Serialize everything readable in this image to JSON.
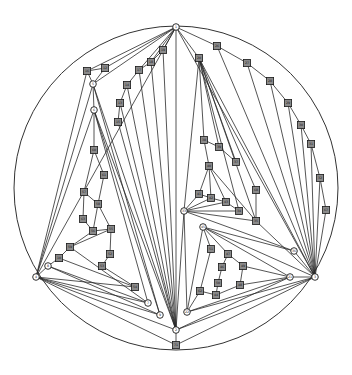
{
  "diagram": {
    "type": "planar-graph-drawing",
    "outer_circle": {
      "cx": 176,
      "cy": 188,
      "r": 162
    },
    "colors": {
      "edge": "#2a2a2a",
      "square_fill": "#8a8a8a",
      "circle_fill": "#ffffff",
      "stroke": "#1a1a1a"
    },
    "nodes": [
      {
        "id": "top",
        "shape": "circle",
        "x": 176,
        "y": 27,
        "label": "1"
      },
      {
        "id": "bot",
        "shape": "circle",
        "x": 176,
        "y": 330,
        "label": "2"
      },
      {
        "id": "botsq",
        "shape": "square",
        "x": 176,
        "y": 345,
        "label": "71"
      },
      {
        "id": "left",
        "shape": "circle",
        "x": 36,
        "y": 277,
        "label": "4"
      },
      {
        "id": "right",
        "shape": "circle",
        "x": 315,
        "y": 277,
        "label": "3"
      },
      {
        "id": "l1",
        "shape": "square",
        "x": 87,
        "y": 71,
        "label": "16"
      },
      {
        "id": "l2",
        "shape": "square",
        "x": 105,
        "y": 68,
        "label": "12"
      },
      {
        "id": "l3",
        "shape": "circle",
        "x": 93,
        "y": 84,
        "label": "5"
      },
      {
        "id": "l4",
        "shape": "circle",
        "x": 94,
        "y": 110,
        "label": "6"
      },
      {
        "id": "c1",
        "shape": "square",
        "x": 163,
        "y": 50,
        "label": "19"
      },
      {
        "id": "c2",
        "shape": "square",
        "x": 151,
        "y": 62,
        "label": "18"
      },
      {
        "id": "c3",
        "shape": "square",
        "x": 139,
        "y": 70,
        "label": "17"
      },
      {
        "id": "c4",
        "shape": "square",
        "x": 127,
        "y": 85,
        "label": "14"
      },
      {
        "id": "c5",
        "shape": "square",
        "x": 120,
        "y": 103,
        "label": "13"
      },
      {
        "id": "c6",
        "shape": "square",
        "x": 118,
        "y": 122,
        "label": "15"
      },
      {
        "id": "i1",
        "shape": "square",
        "x": 94,
        "y": 150,
        "label": "60"
      },
      {
        "id": "i2",
        "shape": "square",
        "x": 104,
        "y": 175,
        "label": "61"
      },
      {
        "id": "i3",
        "shape": "square",
        "x": 84,
        "y": 192,
        "label": "57"
      },
      {
        "id": "i4",
        "shape": "square",
        "x": 98,
        "y": 204,
        "label": "58"
      },
      {
        "id": "i5",
        "shape": "square",
        "x": 83,
        "y": 219,
        "label": "63"
      },
      {
        "id": "i6",
        "shape": "square",
        "x": 93,
        "y": 231,
        "label": "56"
      },
      {
        "id": "i7",
        "shape": "square",
        "x": 111,
        "y": 229,
        "label": "55"
      },
      {
        "id": "i8",
        "shape": "square",
        "x": 110,
        "y": 254,
        "label": "52"
      },
      {
        "id": "i9",
        "shape": "square",
        "x": 70,
        "y": 247,
        "label": "59"
      },
      {
        "id": "i10",
        "shape": "square",
        "x": 59,
        "y": 258,
        "label": "10"
      },
      {
        "id": "i11",
        "shape": "circle",
        "x": 48,
        "y": 266,
        "label": "8"
      },
      {
        "id": "i12",
        "shape": "square",
        "x": 102,
        "y": 266,
        "label": "53"
      },
      {
        "id": "i13",
        "shape": "square",
        "x": 135,
        "y": 287,
        "label": "54"
      },
      {
        "id": "i14",
        "shape": "circle",
        "x": 148,
        "y": 303,
        "label": "7"
      },
      {
        "id": "i15",
        "shape": "circle",
        "x": 160,
        "y": 315,
        "label": "9"
      },
      {
        "id": "r1",
        "shape": "square",
        "x": 217,
        "y": 46,
        "label": "26"
      },
      {
        "id": "r2",
        "shape": "square",
        "x": 199,
        "y": 58,
        "label": "20"
      },
      {
        "id": "r3",
        "shape": "square",
        "x": 247,
        "y": 63,
        "label": "27"
      },
      {
        "id": "r4",
        "shape": "square",
        "x": 270,
        "y": 81,
        "label": "28"
      },
      {
        "id": "r5",
        "shape": "square",
        "x": 288,
        "y": 103,
        "label": "29"
      },
      {
        "id": "r6",
        "shape": "square",
        "x": 301,
        "y": 125,
        "label": "30"
      },
      {
        "id": "r7",
        "shape": "square",
        "x": 311,
        "y": 144,
        "label": "31"
      },
      {
        "id": "r8",
        "shape": "square",
        "x": 320,
        "y": 178,
        "label": "32"
      },
      {
        "id": "r9",
        "shape": "square",
        "x": 326,
        "y": 210,
        "label": "67"
      },
      {
        "id": "m1",
        "shape": "square",
        "x": 204,
        "y": 140,
        "label": "38"
      },
      {
        "id": "m2",
        "shape": "square",
        "x": 219,
        "y": 147,
        "label": "39"
      },
      {
        "id": "m3",
        "shape": "square",
        "x": 236,
        "y": 162,
        "label": "37"
      },
      {
        "id": "m4",
        "shape": "square",
        "x": 209,
        "y": 166,
        "label": "40"
      },
      {
        "id": "m5",
        "shape": "square",
        "x": 256,
        "y": 190,
        "label": "68"
      },
      {
        "id": "m6",
        "shape": "square",
        "x": 199,
        "y": 194,
        "label": "41"
      },
      {
        "id": "m7",
        "shape": "square",
        "x": 211,
        "y": 198,
        "label": "42"
      },
      {
        "id": "m8",
        "shape": "square",
        "x": 226,
        "y": 202,
        "label": "43"
      },
      {
        "id": "m9",
        "shape": "square",
        "x": 239,
        "y": 211,
        "label": "34"
      },
      {
        "id": "m10",
        "shape": "square",
        "x": 256,
        "y": 221,
        "label": "35"
      },
      {
        "id": "mh",
        "shape": "circle",
        "x": 184,
        "y": 211,
        "label": "33"
      },
      {
        "id": "mh2",
        "shape": "circle",
        "x": 203,
        "y": 227,
        "label": "45"
      },
      {
        "id": "mh3",
        "shape": "circle",
        "x": 294,
        "y": 251,
        "label": "36"
      },
      {
        "id": "n1",
        "shape": "square",
        "x": 211,
        "y": 249,
        "label": "51"
      },
      {
        "id": "n2",
        "shape": "square",
        "x": 228,
        "y": 254,
        "label": "47"
      },
      {
        "id": "n3",
        "shape": "square",
        "x": 222,
        "y": 267,
        "label": "46"
      },
      {
        "id": "n4",
        "shape": "square",
        "x": 243,
        "y": 266,
        "label": "49"
      },
      {
        "id": "n5",
        "shape": "square",
        "x": 218,
        "y": 283,
        "label": "50"
      },
      {
        "id": "n6",
        "shape": "square",
        "x": 240,
        "y": 285,
        "label": "48"
      },
      {
        "id": "n7",
        "shape": "square",
        "x": 200,
        "y": 291,
        "label": "62"
      },
      {
        "id": "n8",
        "shape": "square",
        "x": 216,
        "y": 295,
        "label": "44"
      },
      {
        "id": "nh",
        "shape": "circle",
        "x": 290,
        "y": 277,
        "label": "21"
      },
      {
        "id": "nh2",
        "shape": "circle",
        "x": 187,
        "y": 312,
        "label": "22"
      }
    ],
    "edges": [
      [
        "top",
        "bot"
      ],
      [
        "bot",
        "botsq"
      ],
      [
        "top",
        "l1"
      ],
      [
        "top",
        "l2"
      ],
      [
        "top",
        "l3"
      ],
      [
        "l1",
        "l2"
      ],
      [
        "l1",
        "l3"
      ],
      [
        "l2",
        "l3"
      ],
      [
        "top",
        "c1"
      ],
      [
        "top",
        "c2"
      ],
      [
        "top",
        "c3"
      ],
      [
        "c1",
        "c2"
      ],
      [
        "c2",
        "c3"
      ],
      [
        "c3",
        "c4"
      ],
      [
        "c4",
        "c5"
      ],
      [
        "c5",
        "c6"
      ],
      [
        "c1",
        "bot"
      ],
      [
        "c2",
        "bot"
      ],
      [
        "c3",
        "bot"
      ],
      [
        "c4",
        "bot"
      ],
      [
        "c5",
        "bot"
      ],
      [
        "c6",
        "bot"
      ],
      [
        "l1",
        "left"
      ],
      [
        "l3",
        "left"
      ],
      [
        "l3",
        "l4"
      ],
      [
        "l3",
        "bot"
      ],
      [
        "l4",
        "bot"
      ],
      [
        "l4",
        "left"
      ],
      [
        "l4",
        "i1"
      ],
      [
        "l4",
        "i14"
      ],
      [
        "l4",
        "i15"
      ],
      [
        "l3",
        "i15"
      ],
      [
        "i1",
        "i2"
      ],
      [
        "i1",
        "i3"
      ],
      [
        "i2",
        "i4"
      ],
      [
        "i3",
        "i4"
      ],
      [
        "i3",
        "i5"
      ],
      [
        "i4",
        "i6"
      ],
      [
        "i4",
        "i7"
      ],
      [
        "i5",
        "i6"
      ],
      [
        "i6",
        "i7"
      ],
      [
        "i6",
        "i9"
      ],
      [
        "i7",
        "i8"
      ],
      [
        "i8",
        "i12"
      ],
      [
        "i9",
        "i10"
      ],
      [
        "i10",
        "i11"
      ],
      [
        "i9",
        "i7"
      ],
      [
        "i11",
        "left"
      ],
      [
        "i10",
        "i13"
      ],
      [
        "i9",
        "i14"
      ],
      [
        "i11",
        "i14"
      ],
      [
        "i12",
        "i13"
      ],
      [
        "i11",
        "i15"
      ],
      [
        "left",
        "i14"
      ],
      [
        "left",
        "i15"
      ],
      [
        "left",
        "bot"
      ],
      [
        "left",
        "botsq"
      ],
      [
        "left",
        "i13"
      ],
      [
        "top",
        "r1"
      ],
      [
        "top",
        "r2"
      ],
      [
        "r1",
        "r3"
      ],
      [
        "r3",
        "r4"
      ],
      [
        "r4",
        "r5"
      ],
      [
        "r5",
        "r6"
      ],
      [
        "r6",
        "r7"
      ],
      [
        "r7",
        "r8"
      ],
      [
        "r8",
        "r9"
      ],
      [
        "r9",
        "right"
      ],
      [
        "r1",
        "right"
      ],
      [
        "r3",
        "right"
      ],
      [
        "r4",
        "right"
      ],
      [
        "r5",
        "right"
      ],
      [
        "r6",
        "right"
      ],
      [
        "r7",
        "right"
      ],
      [
        "r8",
        "right"
      ],
      [
        "r2",
        "mh"
      ],
      [
        "r2",
        "m1"
      ],
      [
        "r2",
        "m2"
      ],
      [
        "r2",
        "m3"
      ],
      [
        "r2",
        "m9"
      ],
      [
        "r2",
        "m10"
      ],
      [
        "r2",
        "m5"
      ],
      [
        "r2",
        "right"
      ],
      [
        "m1",
        "m4"
      ],
      [
        "m2",
        "m3"
      ],
      [
        "m1",
        "m2"
      ],
      [
        "m4",
        "m6"
      ],
      [
        "m4",
        "m7"
      ],
      [
        "m4",
        "m8"
      ],
      [
        "m4",
        "m10"
      ],
      [
        "m6",
        "m7"
      ],
      [
        "m7",
        "m8"
      ],
      [
        "m8",
        "m9"
      ],
      [
        "mh",
        "m6"
      ],
      [
        "mh",
        "m7"
      ],
      [
        "mh",
        "m8"
      ],
      [
        "mh",
        "m9"
      ],
      [
        "mh",
        "m10"
      ],
      [
        "m5",
        "m10"
      ],
      [
        "mh",
        "mh3"
      ],
      [
        "mh",
        "bot"
      ],
      [
        "mh",
        "nh2"
      ],
      [
        "mh2",
        "nh2"
      ],
      [
        "mh2",
        "n1"
      ],
      [
        "mh2",
        "n2"
      ],
      [
        "mh2",
        "mh3"
      ],
      [
        "mh2",
        "nh"
      ],
      [
        "mh2",
        "right"
      ],
      [
        "n1",
        "n7"
      ],
      [
        "n2",
        "n3"
      ],
      [
        "n2",
        "n4"
      ],
      [
        "n3",
        "n5"
      ],
      [
        "n4",
        "n6"
      ],
      [
        "n5",
        "n8"
      ],
      [
        "n7",
        "n8"
      ],
      [
        "n6",
        "n8"
      ],
      [
        "n4",
        "nh"
      ],
      [
        "n6",
        "nh"
      ],
      [
        "nh2",
        "nh"
      ],
      [
        "nh2",
        "right"
      ],
      [
        "nh2",
        "n7"
      ],
      [
        "nh",
        "right"
      ],
      [
        "mh3",
        "right"
      ],
      [
        "bot",
        "nh"
      ],
      [
        "bot",
        "right"
      ],
      [
        "botsq",
        "right"
      ],
      [
        "top",
        "right"
      ],
      [
        "top",
        "left"
      ],
      [
        "m10",
        "right"
      ]
    ]
  }
}
